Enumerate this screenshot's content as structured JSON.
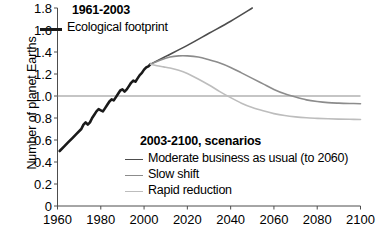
{
  "chart_data": {
    "type": "line",
    "title": "",
    "xlabel": "",
    "ylabel": "Number of planet Earths",
    "xlim": [
      1960,
      2100
    ],
    "ylim": [
      0,
      1.8
    ],
    "xticks": [
      1960,
      1980,
      2000,
      2020,
      2040,
      2060,
      2080,
      2100
    ],
    "yticks": [
      "0",
      "0.2",
      "0.4",
      "0.6",
      "0.8",
      "1.0",
      "1.2",
      "1.4",
      "1.6",
      "1.8"
    ],
    "grid": false,
    "reference_line": {
      "y": 1.0,
      "color": "#8c8c8c",
      "label": ""
    },
    "legend_position": "inside",
    "group_headings": [
      "1961-2003",
      "2003-2100, scenarios"
    ],
    "series": [
      {
        "name": "Ecological footprint",
        "group": "1961-2003",
        "color": "#1a1a1a",
        "width": 2.6,
        "x": [
          1961,
          1963,
          1965,
          1967,
          1969,
          1971,
          1972,
          1973,
          1974,
          1975,
          1976,
          1977,
          1978,
          1979,
          1980,
          1981,
          1982,
          1983,
          1984,
          1985,
          1986,
          1987,
          1988,
          1989,
          1990,
          1991,
          1992,
          1993,
          1994,
          1995,
          1996,
          1997,
          1998,
          1999,
          2000,
          2001,
          2002,
          2003
        ],
        "y": [
          0.5,
          0.54,
          0.58,
          0.62,
          0.66,
          0.7,
          0.74,
          0.76,
          0.74,
          0.76,
          0.8,
          0.83,
          0.86,
          0.88,
          0.87,
          0.86,
          0.89,
          0.92,
          0.95,
          0.97,
          0.96,
          0.99,
          1.02,
          1.05,
          1.06,
          1.04,
          1.06,
          1.09,
          1.12,
          1.14,
          1.13,
          1.16,
          1.19,
          1.21,
          1.24,
          1.26,
          1.27,
          1.29
        ]
      },
      {
        "name": "Moderate business as usual (to 2060)",
        "group": "2003-2100, scenarios",
        "color": "#4d4d4d",
        "width": 1.6,
        "x": [
          2003,
          2010,
          2020,
          2030,
          2040,
          2050
        ],
        "y": [
          1.29,
          1.36,
          1.46,
          1.57,
          1.68,
          1.8
        ]
      },
      {
        "name": "Slow shift",
        "group": "2003-2100, scenarios",
        "color": "#8c8c8c",
        "width": 1.6,
        "x": [
          2003,
          2008,
          2012,
          2016,
          2020,
          2025,
          2030,
          2035,
          2040,
          2045,
          2050,
          2055,
          2060,
          2065,
          2070,
          2075,
          2080,
          2085,
          2090,
          2095,
          2100
        ],
        "y": [
          1.29,
          1.33,
          1.355,
          1.365,
          1.365,
          1.355,
          1.33,
          1.3,
          1.26,
          1.21,
          1.16,
          1.11,
          1.06,
          1.02,
          0.99,
          0.965,
          0.95,
          0.94,
          0.935,
          0.932,
          0.93
        ]
      },
      {
        "name": "Rapid reduction",
        "group": "2003-2100, scenarios",
        "color": "#bdbdbd",
        "width": 1.6,
        "x": [
          2003,
          2006,
          2009,
          2012,
          2016,
          2020,
          2025,
          2030,
          2035,
          2040,
          2045,
          2050,
          2055,
          2060,
          2065,
          2070,
          2075,
          2080,
          2085,
          2090,
          2095,
          2100
        ],
        "y": [
          1.29,
          1.275,
          1.265,
          1.255,
          1.235,
          1.205,
          1.155,
          1.1,
          1.04,
          0.985,
          0.935,
          0.895,
          0.865,
          0.84,
          0.822,
          0.81,
          0.802,
          0.797,
          0.793,
          0.79,
          0.788,
          0.787
        ]
      }
    ]
  },
  "axes": {
    "ylabel": "Number of planet Earths"
  },
  "legend": {
    "historical_heading": "1961-2003",
    "historical_item": "Ecological footprint",
    "scenarios_heading": "2003-2100, scenarios",
    "scenario_items": [
      "Moderate business as usual (to 2060)",
      "Slow shift",
      "Rapid reduction"
    ]
  }
}
